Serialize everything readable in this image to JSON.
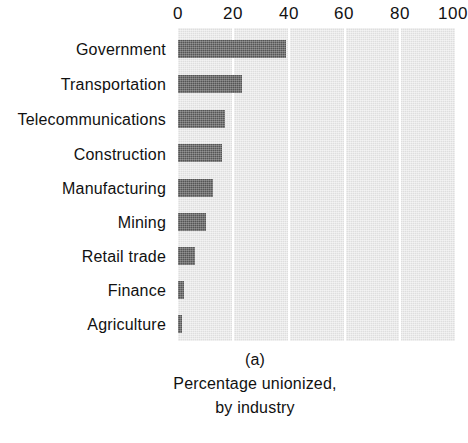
{
  "chart_data": {
    "type": "bar",
    "orientation": "horizontal",
    "title": "",
    "subtitle": "",
    "xlabel": "",
    "ylabel": "",
    "xlim": [
      0,
      100
    ],
    "xticks": [
      0,
      20,
      40,
      60,
      80,
      100
    ],
    "xtick_labels": [
      "0",
      "20",
      "40",
      "60",
      "80",
      "100"
    ],
    "grid": true,
    "legend": "none",
    "categories": [
      "Government",
      "Transportation",
      "Telecommunications",
      "Construction",
      "Manufacturing",
      "Mining",
      "Retail trade",
      "Finance",
      "Agriculture"
    ],
    "values": [
      39,
      23,
      17,
      16,
      12.5,
      10,
      6,
      2,
      1.5
    ],
    "series": [
      {
        "name": "Percentage unionized",
        "values": [
          39,
          23,
          17,
          16,
          12.5,
          10,
          6,
          2,
          1.5
        ]
      }
    ],
    "colors": {
      "bar_fill": "#555555",
      "plot_background": "#dedede",
      "gridline": "#ffffff",
      "text": "#111111",
      "page_background": "#ffffff"
    }
  },
  "caption": {
    "panel_id": "(a)",
    "line1": "Percentage unionized,",
    "line2": "by industry"
  }
}
